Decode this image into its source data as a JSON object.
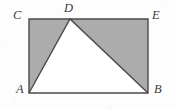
{
  "figure": {
    "kind": "geometry-diagram",
    "background_color": "#fdfdfd",
    "shaded_fill_color": "#acacac",
    "unshaded_fill_color": "#ffffff",
    "stroke_color": "#4a4a4a",
    "label_color": "#3a3a3a",
    "rectangle": {
      "name": "ABEC",
      "corners": {
        "C": {
          "x": 29,
          "y": 19
        },
        "E": {
          "x": 148,
          "y": 19
        },
        "B": {
          "x": 148,
          "y": 93
        },
        "A": {
          "x": 29,
          "y": 93
        }
      }
    },
    "triangle": {
      "name": "ADB",
      "fill": "unshaded",
      "vertices": {
        "A": {
          "x": 29,
          "y": 93
        },
        "D": {
          "x": 70,
          "y": 19
        },
        "B": {
          "x": 148,
          "y": 93
        }
      }
    },
    "labels": [
      {
        "id": "C",
        "text": "C",
        "position": "top-left-outside"
      },
      {
        "id": "D",
        "text": "D",
        "position": "top-apex-above"
      },
      {
        "id": "E",
        "text": "E",
        "position": "top-right-outside"
      },
      {
        "id": "A",
        "text": "A",
        "position": "bottom-left-outside"
      },
      {
        "id": "B",
        "text": "B",
        "position": "bottom-right-outside"
      }
    ]
  }
}
